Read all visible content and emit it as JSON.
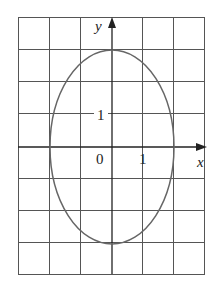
{
  "diagram": {
    "type": "ellipse-on-grid",
    "equation_hint": "x^2/4 + y^2/9 = 1",
    "x_axis_label": "x",
    "y_axis_label": "y",
    "origin_label": "0",
    "x_tick_label": "1",
    "y_tick_label": "1",
    "grid": {
      "columns": 6,
      "rows": 8,
      "x_range": [
        -3,
        3
      ],
      "y_range": [
        -4,
        4
      ]
    },
    "ellipse": {
      "center": [
        0,
        0
      ],
      "semi_x": 2,
      "semi_y": 3
    },
    "colors": {
      "grid": "#555555",
      "curve": "#666666",
      "axis": "#222222"
    }
  }
}
